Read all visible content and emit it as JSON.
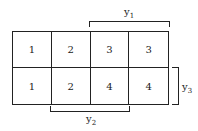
{
  "diagram": {
    "type": "karnaugh-style grid",
    "rows": [
      [
        "1",
        "2",
        "3",
        "3"
      ],
      [
        "1",
        "2",
        "4",
        "4"
      ]
    ],
    "brackets": [
      {
        "label": "y",
        "subscript": "1",
        "position": "top",
        "spans_columns": [
          3,
          4
        ]
      },
      {
        "label": "y",
        "subscript": "2",
        "position": "bottom",
        "spans_columns": [
          2,
          3
        ]
      },
      {
        "label": "y",
        "subscript": "3",
        "position": "right",
        "spans_rows": [
          2
        ]
      }
    ]
  }
}
